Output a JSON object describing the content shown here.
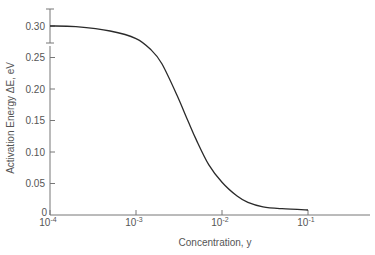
{
  "chart_data": {
    "type": "line",
    "title": "",
    "xlabel": "Concentration, y",
    "ylabel": "Activation Energy ΔE, eV",
    "x_scale": "log",
    "xlim": [
      0.0001,
      0.5
    ],
    "ylim": [
      0,
      0.3
    ],
    "x_ticks": [
      {
        "base": "10",
        "exp": "-4",
        "value": 0.0001
      },
      {
        "base": "10",
        "exp": "-3",
        "value": 0.001
      },
      {
        "base": "10",
        "exp": "-2",
        "value": 0.01
      },
      {
        "base": "10",
        "exp": "-1",
        "value": 0.1
      }
    ],
    "y_ticks": [
      "0",
      "0.05",
      "0.10",
      "0.15",
      "0.20",
      "0.25",
      "0.30"
    ],
    "y_tick_values": [
      0,
      0.05,
      0.1,
      0.15,
      0.2,
      0.25,
      0.3
    ],
    "grid": false,
    "legend": null,
    "annotations": [
      "error bar on y-axis around 0.30"
    ],
    "series": [
      {
        "name": "ΔE",
        "x": [
          0.0001,
          0.0002,
          0.0005,
          0.001,
          0.0015,
          0.002,
          0.003,
          0.004,
          0.005,
          0.007,
          0.01,
          0.015,
          0.02,
          0.03,
          0.05,
          0.1
        ],
        "y": [
          0.3,
          0.299,
          0.292,
          0.28,
          0.262,
          0.24,
          0.19,
          0.15,
          0.12,
          0.08,
          0.052,
          0.03,
          0.02,
          0.013,
          0.01,
          0.008
        ]
      }
    ]
  }
}
